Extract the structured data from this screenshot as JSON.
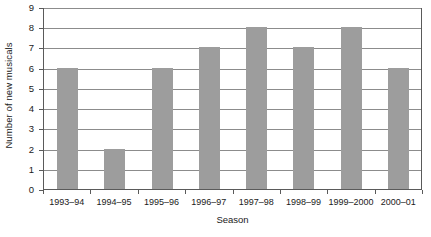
{
  "chart_data": {
    "type": "bar",
    "title": "",
    "xlabel": "Season",
    "ylabel": "Number of new musicals",
    "categories": [
      "1993–94",
      "1994–95",
      "1995–96",
      "1996–97",
      "1997–98",
      "1998–99",
      "1999–2000",
      "2000–01"
    ],
    "values": [
      6,
      2,
      6,
      7,
      8,
      7,
      8,
      6
    ],
    "ylim": [
      0,
      9
    ],
    "yticks": [
      0,
      1,
      2,
      3,
      4,
      5,
      6,
      7,
      8,
      9
    ],
    "ytick_labels": [
      "0",
      "1",
      "2",
      "3",
      "4",
      "5",
      "6",
      "7",
      "8",
      "9"
    ],
    "grid": true,
    "grid_axis": "y",
    "legend": false,
    "legend_position": "none",
    "bar_color": "#9d9d9d",
    "gridline_color": "#8c8c8c",
    "axis_color": "#5a5a5a",
    "background_color": "#ffffff"
  }
}
